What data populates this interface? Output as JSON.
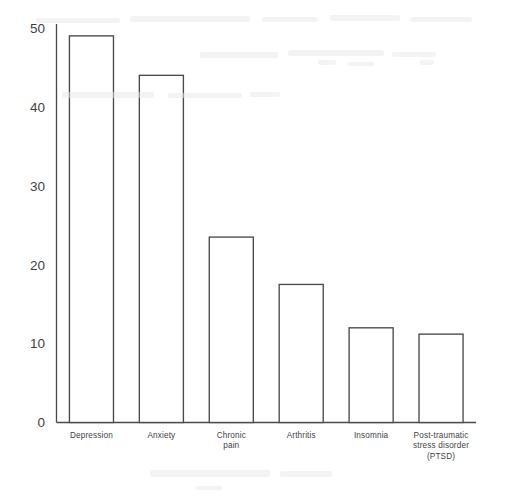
{
  "chart_data": {
    "type": "bar",
    "title": "",
    "subtitle": "",
    "xlabel": "",
    "ylabel": "",
    "categories": [
      "Depression",
      "Anxiety",
      "Chronic pain",
      "Arthritis",
      "Insomnia",
      "Post-traumatic stress disorder (PTSD)"
    ],
    "category_lines": [
      [
        "Depression"
      ],
      [
        "Anxiety"
      ],
      [
        "Chronic",
        "pain"
      ],
      [
        "Arthritis"
      ],
      [
        "Insomnia"
      ],
      [
        "Post-traumatic",
        "stress disorder",
        "(PTSD)"
      ]
    ],
    "values": [
      49,
      44,
      23.5,
      17.5,
      12,
      11.2
    ],
    "ylim": [
      0,
      50
    ],
    "yticks": [
      0,
      10,
      20,
      30,
      40,
      50
    ],
    "ytick_labels": [
      "0",
      "10",
      "20",
      "30",
      "40",
      "50"
    ],
    "grid": false,
    "legend": false,
    "legend_position": "none",
    "bar_fill": "#ffffff",
    "bar_stroke": "#4a4a4a",
    "axis_color": "#4a4a4a",
    "background": "#ffffff"
  }
}
